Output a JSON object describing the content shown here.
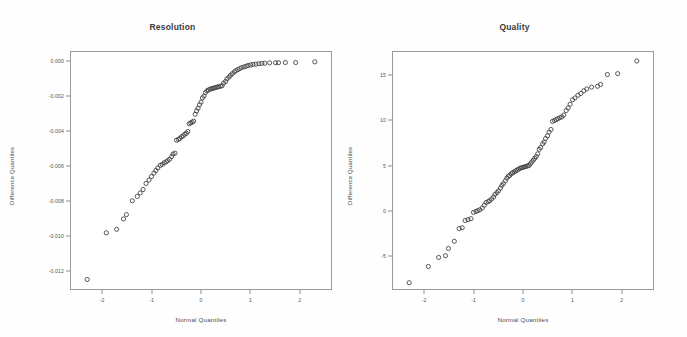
{
  "figure": {
    "background_color": "#fefefe",
    "point_color": "#3a3a3a",
    "axis_color": "#9a9a9a",
    "marker": "open-circle"
  },
  "chart_data": [
    {
      "type": "scatter",
      "title": "Resolution",
      "xlabel": "Normal Quantiles",
      "ylabel": "Difference Quantiles",
      "xlim": [
        -2.65,
        2.65
      ],
      "ylim": [
        -0.0131,
        0.0006
      ],
      "xticks": [
        -2,
        -1,
        0,
        1,
        2
      ],
      "xticklabels": [
        "-2",
        "-1",
        "0",
        "1",
        "2"
      ],
      "yticks": [
        0.0,
        -0.002,
        -0.004,
        -0.006,
        -0.008,
        -0.01,
        -0.012
      ],
      "yticklabels": [
        "0.000",
        "-0.002",
        "-0.004",
        "-0.006",
        "-0.008",
        "-0.010",
        "-0.012"
      ],
      "grid": false,
      "legend": null,
      "x": [
        -2.32,
        -1.93,
        -1.72,
        -1.58,
        -1.52,
        -1.4,
        -1.3,
        -1.24,
        -1.18,
        -1.12,
        -1.06,
        -1.01,
        -0.96,
        -0.92,
        -0.88,
        -0.83,
        -0.79,
        -0.75,
        -0.71,
        -0.68,
        -0.64,
        -0.6,
        -0.57,
        -0.53,
        -0.5,
        -0.46,
        -0.43,
        -0.4,
        -0.36,
        -0.33,
        -0.3,
        -0.27,
        -0.24,
        -0.21,
        -0.18,
        -0.15,
        -0.12,
        -0.09,
        -0.06,
        -0.03,
        0.0,
        0.03,
        0.06,
        0.09,
        0.12,
        0.15,
        0.18,
        0.21,
        0.24,
        0.27,
        0.3,
        0.33,
        0.36,
        0.4,
        0.43,
        0.46,
        0.5,
        0.53,
        0.57,
        0.6,
        0.64,
        0.68,
        0.71,
        0.75,
        0.79,
        0.83,
        0.88,
        0.92,
        0.96,
        1.01,
        1.06,
        1.12,
        1.18,
        1.24,
        1.3,
        1.4,
        1.52,
        1.58,
        1.72,
        1.93,
        2.32
      ],
      "y": [
        -0.01255,
        -0.00985,
        -0.00965,
        -0.00905,
        -0.0088,
        -0.008,
        -0.00775,
        -0.00755,
        -0.00735,
        -0.007,
        -0.0068,
        -0.0066,
        -0.0064,
        -0.00625,
        -0.0061,
        -0.00595,
        -0.0059,
        -0.0058,
        -0.00575,
        -0.00568,
        -0.0056,
        -0.00545,
        -0.0053,
        -0.00525,
        -0.0045,
        -0.00445,
        -0.0044,
        -0.0043,
        -0.00425,
        -0.00415,
        -0.0041,
        -0.004,
        -0.00355,
        -0.0035,
        -0.00345,
        -0.0034,
        -0.003,
        -0.0028,
        -0.00265,
        -0.00245,
        -0.0023,
        -0.00205,
        -0.00195,
        -0.00175,
        -0.00165,
        -0.0016,
        -0.00155,
        -0.00152,
        -0.0015,
        -0.00148,
        -0.00145,
        -0.00143,
        -0.0014,
        -0.00138,
        -0.00135,
        -0.0012,
        -0.0011,
        -0.00095,
        -0.00085,
        -0.00075,
        -0.00065,
        -0.00055,
        -0.00048,
        -0.00042,
        -0.00036,
        -0.0003,
        -0.00026,
        -0.00022,
        -0.00018,
        -0.00015,
        -0.00012,
        -0.0001,
        -8e-05,
        -6e-05,
        -5e-05,
        -3e-05,
        -2e-05,
        -2e-05,
        -1e-05,
        -1e-05,
        3e-05
      ]
    },
    {
      "type": "scatter",
      "title": "Quality",
      "xlabel": "Normal Quantiles",
      "ylabel": "Difference Quantiles",
      "xlim": [
        -2.65,
        2.65
      ],
      "ylim": [
        -8.7,
        17.6
      ],
      "xticks": [
        -2,
        -1,
        0,
        1,
        2
      ],
      "xticklabels": [
        "-2",
        "-1",
        "0",
        "1",
        "2"
      ],
      "yticks": [
        15,
        10,
        5,
        0,
        -5
      ],
      "yticklabels": [
        "15",
        "10",
        "5",
        "0",
        "-5"
      ],
      "grid": false,
      "legend": null,
      "x": [
        -2.32,
        -1.93,
        -1.72,
        -1.58,
        -1.52,
        -1.4,
        -1.3,
        -1.24,
        -1.18,
        -1.12,
        -1.06,
        -1.01,
        -0.96,
        -0.92,
        -0.88,
        -0.83,
        -0.79,
        -0.75,
        -0.71,
        -0.68,
        -0.64,
        -0.6,
        -0.57,
        -0.53,
        -0.5,
        -0.46,
        -0.43,
        -0.4,
        -0.36,
        -0.33,
        -0.3,
        -0.27,
        -0.24,
        -0.21,
        -0.18,
        -0.15,
        -0.12,
        -0.09,
        -0.06,
        -0.03,
        0.0,
        0.03,
        0.06,
        0.09,
        0.12,
        0.15,
        0.18,
        0.21,
        0.24,
        0.27,
        0.3,
        0.33,
        0.36,
        0.4,
        0.43,
        0.46,
        0.5,
        0.53,
        0.57,
        0.6,
        0.64,
        0.68,
        0.71,
        0.75,
        0.79,
        0.83,
        0.88,
        0.92,
        0.96,
        1.01,
        1.06,
        1.12,
        1.18,
        1.24,
        1.3,
        1.4,
        1.52,
        1.58,
        1.72,
        1.93,
        2.32
      ],
      "y": [
        -8.0,
        -6.2,
        -5.2,
        -5.0,
        -4.2,
        -3.4,
        -2.0,
        -1.9,
        -1.1,
        -1.0,
        -0.9,
        -0.2,
        -0.1,
        0.0,
        0.1,
        0.3,
        0.6,
        0.9,
        1.0,
        1.1,
        1.3,
        1.5,
        1.8,
        2.0,
        2.2,
        2.5,
        2.8,
        3.0,
        3.3,
        3.6,
        3.8,
        3.9,
        4.1,
        4.2,
        4.3,
        4.4,
        4.5,
        4.6,
        4.7,
        4.75,
        4.8,
        4.85,
        4.9,
        4.95,
        5.0,
        5.2,
        5.4,
        5.6,
        5.8,
        6.0,
        6.3,
        6.8,
        7.0,
        7.4,
        7.6,
        8.0,
        8.3,
        8.7,
        9.0,
        9.9,
        10.0,
        10.1,
        10.2,
        10.3,
        10.4,
        10.6,
        11.1,
        11.4,
        11.8,
        12.3,
        12.5,
        12.8,
        13.0,
        13.3,
        13.5,
        13.7,
        13.8,
        14.0,
        15.1,
        15.2,
        16.6
      ]
    }
  ]
}
